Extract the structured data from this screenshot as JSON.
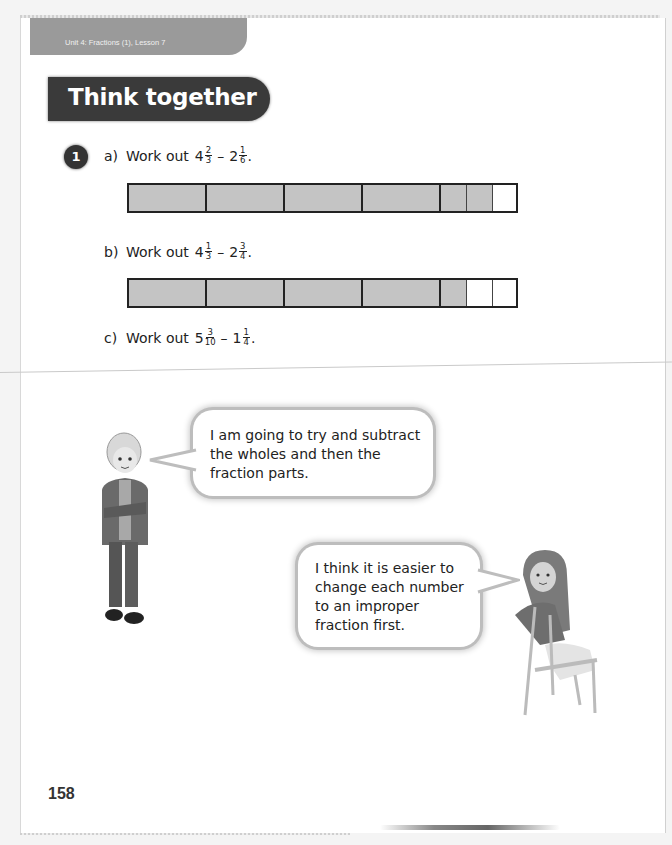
{
  "header": {
    "unit_label": "Unit 4: Fractions (1), Lesson 7",
    "section_title": "Think together"
  },
  "question": {
    "number": "1",
    "parts": [
      {
        "label": "a)",
        "prompt": "Work out",
        "a_whole": "4",
        "a_num": "2",
        "a_den": "3",
        "op": "–",
        "b_whole": "2",
        "b_num": "1",
        "b_den": "6",
        "end": ".",
        "bar": {
          "whole_units": 4,
          "shaded_sixths": 2,
          "unshaded_sixths": 1
        }
      },
      {
        "label": "b)",
        "prompt": "Work out",
        "a_whole": "4",
        "a_num": "1",
        "a_den": "3",
        "op": "–",
        "b_whole": "2",
        "b_num": "3",
        "b_den": "4",
        "end": ".",
        "bar": {
          "whole_units": 4,
          "shaded_parts": 1,
          "unshaded_parts": 2
        }
      },
      {
        "label": "c)",
        "prompt": "Work out",
        "a_whole": "5",
        "a_num": "3",
        "a_den": "10",
        "op": "–",
        "b_whole": "1",
        "b_num": "1",
        "b_den": "4",
        "end": "."
      }
    ]
  },
  "speech": {
    "boy": "I am going to try and subtract the wholes and then the fraction parts.",
    "girl": "I think it is easier to change each number to an improper fraction first."
  },
  "footer": {
    "page_number": "158"
  },
  "colors": {
    "shaded": "#c4c4c4",
    "title_bg": "#3a3a3a",
    "unit_tab_bg": "#9a9a9a"
  }
}
